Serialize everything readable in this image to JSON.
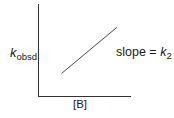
{
  "diagram": {
    "type": "plot-sketch",
    "y_axis_label": {
      "symbol": "k",
      "subscript": "obsd"
    },
    "x_axis_label": "[B]",
    "line_annotation": {
      "prefix": "slope = ",
      "symbol": "k",
      "subscript": "2"
    },
    "colors": {
      "axis": "#333333",
      "line": "#4a4a4a",
      "text": "#1a1a1a"
    }
  },
  "chart_data": {
    "type": "line",
    "title": "",
    "xlabel": "[B]",
    "ylabel": "k_obsd",
    "series": [
      {
        "name": "k_obsd vs [B]",
        "x": [
          0.25,
          0.85
        ],
        "y": [
          0.25,
          0.75
        ]
      }
    ],
    "xlim": [
      0,
      1
    ],
    "ylim": [
      0,
      1
    ],
    "annotations": [
      "slope = k_2"
    ],
    "grid": false
  }
}
